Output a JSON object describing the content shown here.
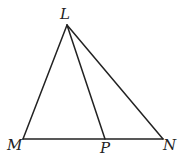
{
  "diagram": {
    "type": "triangle-with-cevian",
    "line_color": "#222222",
    "background": "#ffffff",
    "points": {
      "L": {
        "label": "L",
        "x": 67,
        "y": 25
      },
      "M": {
        "label": "M",
        "x": 23,
        "y": 139
      },
      "P": {
        "label": "P",
        "x": 105,
        "y": 139
      },
      "N": {
        "label": "N",
        "x": 163,
        "y": 139
      }
    },
    "segments": [
      "LM",
      "LN",
      "LP",
      "MN"
    ]
  }
}
